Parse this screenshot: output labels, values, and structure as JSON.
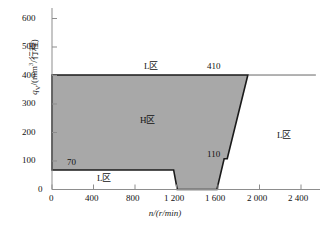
{
  "chart_data": {
    "type": "area",
    "title": "",
    "subtitle": "",
    "xlabel": "n/(r/min)",
    "ylabel": "q_V/(mm³/行程)",
    "xlabel_parts": {
      "var": "n",
      "slash": "/(",
      "unit": "r/min",
      "close": ")"
    },
    "ylabel_parts": {
      "var": "q",
      "sub": "V",
      "slash": "/(mm",
      "sup": "3",
      "unit": "/行程)"
    },
    "xlim": [
      0,
      2600
    ],
    "ylim": [
      0,
      650
    ],
    "xticks": [
      0,
      400,
      800,
      1200,
      1600,
      2000,
      2400
    ],
    "xtick_labels": [
      "0",
      "400",
      "800",
      "1 200",
      "1 600",
      "2 000",
      "2 400"
    ],
    "yticks": [
      0,
      100,
      200,
      300,
      400,
      500,
      600
    ],
    "ytick_labels": [
      "0",
      "100",
      "200",
      "300",
      "400",
      "500",
      "600"
    ],
    "grid": false,
    "legend": "none",
    "series": [
      {
        "name": "H区 operating envelope",
        "fill_color": "#a8a8a8",
        "edge_color": "#1a1a1a",
        "polygon": [
          [
            0,
            410
          ],
          [
            1900,
            410
          ],
          [
            1700,
            110
          ],
          [
            1670,
            110
          ],
          [
            1600,
            0
          ],
          [
            1215,
            0
          ],
          [
            1180,
            70
          ],
          [
            0,
            70
          ]
        ]
      }
    ],
    "reference_lines": [
      {
        "name": "410-level line",
        "y": 410,
        "x_from": 1900,
        "x_to": 2560,
        "color": "#1a1a1a"
      }
    ],
    "data_labels": [
      {
        "text": "70",
        "x": 330,
        "y": 95,
        "anchor": "inside-left-bottom"
      },
      {
        "text": "410",
        "x": 1450,
        "y": 455,
        "anchor": "above-top-edge"
      },
      {
        "text": "110",
        "x": 1540,
        "y": 150,
        "anchor": "left-of-step"
      }
    ],
    "region_labels": [
      {
        "text": "L区",
        "x": 930,
        "y": 455,
        "region": "upper-L"
      },
      {
        "text": "H区",
        "x": 960,
        "y": 250,
        "region": "center-H"
      },
      {
        "text": "L区",
        "x": 640,
        "y": 35,
        "region": "lower-L"
      },
      {
        "text": "L区",
        "x": 2220,
        "y": 195,
        "region": "right-L"
      }
    ],
    "colors": {
      "fill": "#a8a8a8",
      "outline": "#1a1a1a",
      "axis": "#8a8a8a",
      "text": "#111111",
      "background": "#ffffff"
    }
  },
  "axis": {
    "y_ticks": [
      "600",
      "500",
      "400",
      "300",
      "200",
      "100",
      "0"
    ],
    "x_ticks": [
      "0",
      "400",
      "800",
      "1 200",
      "1 600",
      "2 000",
      "2 400"
    ],
    "y_title_var": "q",
    "y_title_sub": "V",
    "y_title_mid": "/(mm",
    "y_title_sup": "3",
    "y_title_end": "/行程)",
    "x_title_var": "n",
    "x_title_rest": "/(r/min)"
  },
  "annotations": {
    "label_70": "70",
    "label_410": "410",
    "label_110": "110",
    "region_upper_L": "L区",
    "region_center_H": "H区",
    "region_lower_L": "L区",
    "region_right_L": "L区"
  }
}
